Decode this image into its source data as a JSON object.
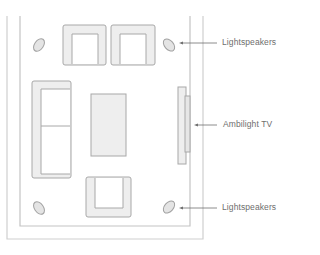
{
  "diagram": {
    "colors": {
      "wall": "#c8c8c8",
      "furniture_fill": "#eeeeee",
      "furniture_stroke": "#a8a8a8",
      "speaker_fill": "#e4e4e4",
      "speaker_stroke": "#a0a0a0",
      "arrow": "#6e6e6e",
      "label": "#6e6e6e"
    },
    "labels": {
      "top_speakers": "Lightspeakers",
      "tv": "Ambilight TV",
      "bottom_speakers": "Lightspeakers"
    },
    "elements": [
      {
        "type": "wall-outer"
      },
      {
        "type": "wall-inner"
      },
      {
        "type": "armchair",
        "position": "top-left"
      },
      {
        "type": "armchair",
        "position": "top-right"
      },
      {
        "type": "sofa",
        "position": "left",
        "seats": 2
      },
      {
        "type": "coffee-table",
        "position": "center"
      },
      {
        "type": "tv",
        "position": "right-wall"
      },
      {
        "type": "armchair",
        "position": "bottom"
      },
      {
        "type": "speaker",
        "position": "top-left"
      },
      {
        "type": "speaker",
        "position": "top-right"
      },
      {
        "type": "speaker",
        "position": "bottom-left"
      },
      {
        "type": "speaker",
        "position": "bottom-right"
      }
    ]
  }
}
